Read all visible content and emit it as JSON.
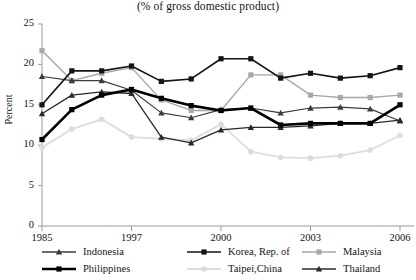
{
  "chart_data": {
    "type": "line",
    "title": "(% of gross domestic product)",
    "xlabel": "",
    "ylabel": "Percent",
    "ylim": [
      0,
      25
    ],
    "ytick_values": [
      0,
      5,
      10,
      15,
      20,
      25
    ],
    "ytick_labels": [
      "0",
      "5",
      "10",
      "15",
      "20",
      "25"
    ],
    "grid": false,
    "legend_position": "bottom",
    "x": [
      "1985",
      "1995",
      "1996",
      "1997",
      "1998",
      "1999",
      "2000",
      "2001",
      "2002",
      "2003",
      "2004",
      "2005",
      "2006"
    ],
    "xtick_labels": [
      "1985",
      "1997",
      "2000",
      "2003",
      "2006"
    ],
    "xtick_x": [
      "1985",
      "1997",
      "2000",
      "2003",
      "2006"
    ],
    "series": [
      {
        "name": "Indonesia",
        "color": "#3c3c3c",
        "marker": "triangle",
        "width": 1.2,
        "values": [
          18.5,
          18.0,
          18.0,
          16.8,
          14.0,
          13.4,
          14.4,
          14.6,
          14.0,
          14.6,
          14.7,
          14.5,
          13.0
        ]
      },
      {
        "name": "Korea, Rep. of",
        "color": "#141414",
        "marker": "square",
        "width": 1.6,
        "values": [
          15.0,
          19.2,
          19.2,
          19.8,
          17.9,
          18.2,
          20.7,
          20.7,
          18.3,
          18.9,
          18.3,
          18.6,
          19.6
        ]
      },
      {
        "name": "Malaysia",
        "color": "#a8a8a8",
        "marker": "square",
        "width": 1.4,
        "values": [
          21.7,
          18.0,
          18.9,
          19.6,
          15.6,
          14.3,
          14.3,
          18.7,
          18.7,
          16.2,
          15.9,
          15.9,
          16.2
        ]
      },
      {
        "name": "Philippines",
        "color": "#000000",
        "marker": "square",
        "width": 2.6,
        "values": [
          10.7,
          14.4,
          16.2,
          16.9,
          15.8,
          14.9,
          14.3,
          14.6,
          12.5,
          12.7,
          12.7,
          12.7,
          15.0
        ]
      },
      {
        "name": "Taipei,China",
        "color": "#dcdcdc",
        "marker": "circle",
        "width": 1.8,
        "values": [
          9.7,
          12.0,
          13.2,
          11.0,
          10.8,
          10.6,
          12.6,
          9.2,
          8.5,
          8.4,
          8.7,
          9.4,
          11.2
        ]
      },
      {
        "name": "Thailand",
        "color": "#2a2a2a",
        "marker": "triangle",
        "width": 1.3,
        "values": [
          13.9,
          16.2,
          16.6,
          16.4,
          11.0,
          10.3,
          11.9,
          12.2,
          12.2,
          12.4,
          12.7,
          12.7,
          13.1
        ]
      }
    ]
  },
  "legend": {
    "row1": [
      "Indonesia",
      "Korea, Rep. of",
      "Malaysia"
    ],
    "row2": [
      "Philippines",
      "Taipei,China",
      "Thailand"
    ]
  }
}
